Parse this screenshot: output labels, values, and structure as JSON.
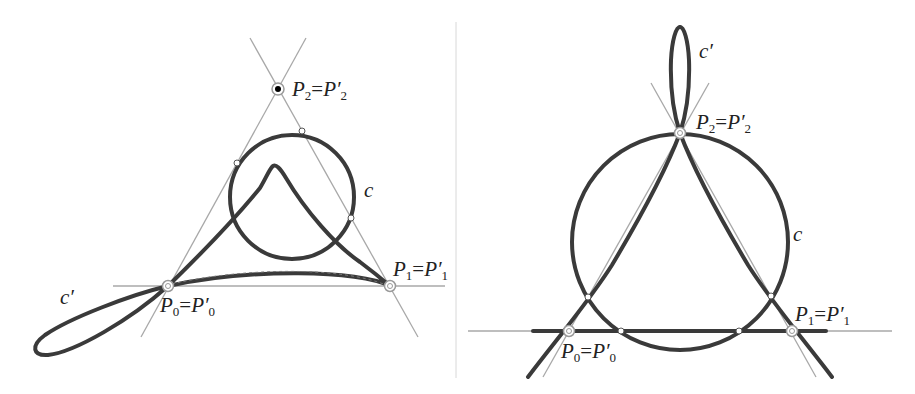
{
  "figure": {
    "panels": [
      {
        "id": "left",
        "labels": {
          "p0": {
            "main": "P",
            "sub": "0",
            "eq": "=",
            "main2": "P′",
            "sub2": "0"
          },
          "p1": {
            "main": "P",
            "sub": "1",
            "eq": "=",
            "main2": "P′",
            "sub2": "1"
          },
          "p2": {
            "main": "P",
            "sub": "2",
            "eq": "=",
            "main2": "P′",
            "sub2": "2"
          },
          "circle": "c",
          "curve": "c′"
        }
      },
      {
        "id": "right",
        "labels": {
          "p0": {
            "main": "P",
            "sub": "0",
            "eq": "=",
            "main2": "P′",
            "sub2": "0"
          },
          "p1": {
            "main": "P",
            "sub": "1",
            "eq": "=",
            "main2": "P′",
            "sub2": "1"
          },
          "p2": {
            "main": "P",
            "sub": "2",
            "eq": "=",
            "main2": "P′",
            "sub2": "2"
          },
          "circle": "c",
          "curve": "c′"
        }
      }
    ],
    "colors": {
      "curve": "#3a3a3a",
      "guide_lines": "#a8a8a8",
      "background": "#ffffff"
    }
  }
}
